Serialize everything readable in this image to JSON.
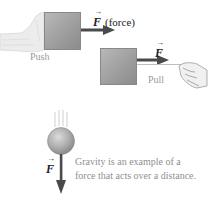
{
  "push_panel": {
    "force_symbol": "F",
    "force_label": "(force)",
    "caption": "Push"
  },
  "pull_panel": {
    "force_symbol": "F",
    "caption": "Pull"
  },
  "gravity_panel": {
    "force_symbol": "F",
    "caption_line1": "Gravity is an example of a",
    "caption_line2": "force that acts over a distance."
  },
  "colors": {
    "box": "#a0a0a0",
    "arrow": "#4a4a4a",
    "caption": "#9a9a9a",
    "ball": "#a8a8a8"
  }
}
